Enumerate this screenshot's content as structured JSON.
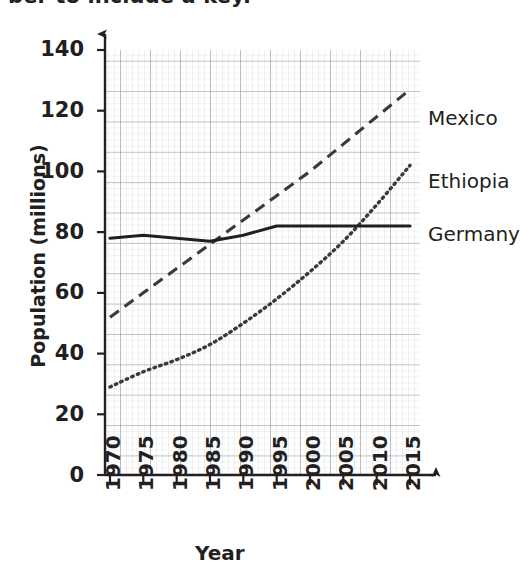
{
  "caption": {
    "text": "ber to include a key."
  },
  "chart_data": {
    "type": "line",
    "title": "",
    "xlabel": "Year",
    "ylabel": "Population (millions)",
    "xlim": [
      1970,
      2015
    ],
    "ylim": [
      0,
      140
    ],
    "xticks": [
      "1970",
      "1975",
      "1980",
      "1985",
      "1990",
      "1995",
      "2000",
      "2005",
      "2010",
      "2015"
    ],
    "yticks": [
      "0",
      "20",
      "40",
      "60",
      "80",
      "100",
      "120",
      "140"
    ],
    "grid": true,
    "grid_style": "graph-paper minor 2mm / major 10mm",
    "legend_position": "right-inline-labels",
    "x": [
      1970,
      1975,
      1980,
      1985,
      1990,
      1995,
      2000,
      2005,
      2010,
      2015
    ],
    "series": [
      {
        "name": "Mexico",
        "line_style": "dashed",
        "color": "#3a3a3a",
        "values": [
          52,
          60,
          68,
          76,
          84,
          92,
          100,
          109,
          118,
          127
        ]
      },
      {
        "name": "Ethiopia",
        "line_style": "dotted",
        "color": "#3a3a3a",
        "values": [
          29,
          34,
          38,
          43,
          50,
          58,
          67,
          77,
          89,
          102
        ]
      },
      {
        "name": "Germany",
        "line_style": "solid",
        "color": "#231f20",
        "values": [
          78,
          79,
          78,
          77,
          79,
          82,
          82,
          82,
          82,
          82
        ]
      }
    ]
  },
  "axes": {
    "y_arrow": "up-arrow",
    "x_arrow": "right-arrow"
  },
  "series_labels": [
    {
      "name": "Mexico"
    },
    {
      "name": "Ethiopia"
    },
    {
      "name": "Germany"
    }
  ]
}
